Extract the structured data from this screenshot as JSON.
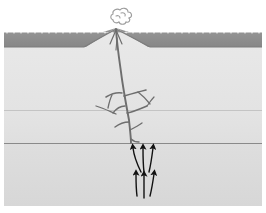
{
  "figure": {
    "width": 266,
    "height": 213,
    "background": "#ffffff"
  },
  "palette": {
    "sky": "#ffffff",
    "surface_dark_layer": "#8c8c8c",
    "surface_layer_edge": "#6f6f6f",
    "upper_crust": "#e6e6e6",
    "middle_crust": "#e2e2e2",
    "lower_crust": "#dcdcdc",
    "boundary_line": "#8a8a8a",
    "conduit": "#6b6b6b",
    "arrow": "#1a1a1a",
    "plume_outline": "#9a9a9a"
  },
  "layers": [
    {
      "name": "sky",
      "label": "Sky / atmosphere",
      "y_top": 0,
      "y_bottom": 32,
      "fill": "#ffffff"
    },
    {
      "name": "surface-deposit",
      "label": "Dark surface deposit",
      "y_top": 32,
      "y_bottom": 47,
      "fill": "#8c8c8c"
    },
    {
      "name": "upper-crust",
      "label": "Upper sedimentary layer",
      "y_top": 47,
      "y_bottom": 110,
      "fill": "#e6e6e6"
    },
    {
      "name": "middle-crust",
      "label": "Middle sedimentary layer",
      "y_top": 110,
      "y_bottom": 143,
      "fill": "#e2e2e2"
    },
    {
      "name": "lower-crust",
      "label": "Lower basement layer",
      "y_top": 143,
      "y_bottom": 206,
      "fill": "#dcdcdc"
    }
  ],
  "volcano": {
    "label": "Volcanic cone",
    "summit_x": 116,
    "summit_y": 28,
    "base_left_x": 86,
    "base_right_x": 148,
    "base_y": 47
  },
  "plume": {
    "label": "Eruption smoke plume",
    "center_x": 122,
    "center_y": 17,
    "radius": 10
  },
  "conduit": {
    "label": "Magma conduit and dike network",
    "main_top_x": 116,
    "main_top_y": 30,
    "root_x": 131,
    "root_y": 143,
    "branch_count": 6
  },
  "arrows": {
    "label": "Magma ascent arrows",
    "count": 6,
    "direction": "up",
    "upper_row_y": 150,
    "lower_row_y": 175
  },
  "annotations": {
    "caption": ""
  }
}
